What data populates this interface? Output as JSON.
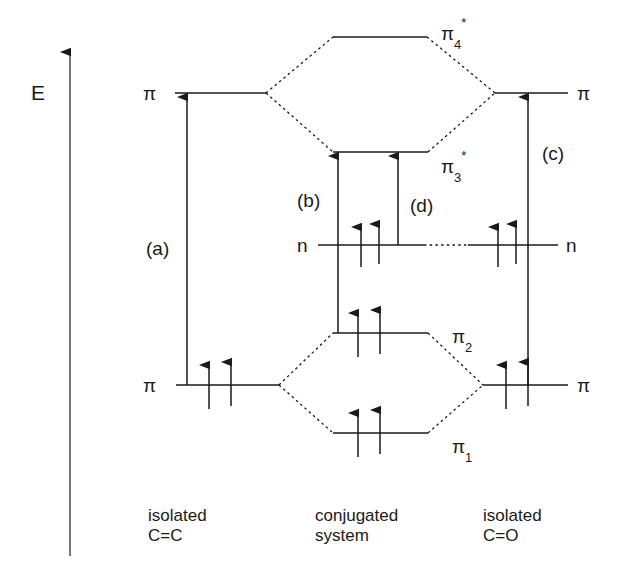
{
  "figure": {
    "kind": "molecular-orbital-energy-level-diagram",
    "energy_axis_label": "E"
  },
  "levels": {
    "left_pi_star": {
      "label": "π",
      "electrons": 0
    },
    "left_pi": {
      "label": "π",
      "electrons": 2
    },
    "center_pi4": {
      "label_base": "π",
      "label_sub": "4",
      "label_star": "*",
      "electrons": 0
    },
    "center_pi3": {
      "label_base": "π",
      "label_sub": "3",
      "label_star": "*",
      "electrons": 0
    },
    "center_pi2": {
      "label_base": "π",
      "label_sub": "2",
      "label_star": "",
      "electrons": 2
    },
    "center_pi1": {
      "label_base": "π",
      "label_sub": "1",
      "label_star": "",
      "electrons": 2
    },
    "left_n": {
      "label": "n",
      "electrons": 2
    },
    "right_n": {
      "label": "n",
      "electrons": 2
    },
    "right_pi_star": {
      "label": "π",
      "electrons": 0
    },
    "right_pi": {
      "label": "π",
      "electrons": 2
    }
  },
  "transitions": {
    "a": {
      "label": "(a)",
      "from": "left_pi",
      "to": "left_pi_star"
    },
    "b": {
      "label": "(b)",
      "from": "center_pi2",
      "to": "center_pi3"
    },
    "c": {
      "label": "(c)",
      "from": "right_pi",
      "to": "right_pi_star"
    },
    "d": {
      "label": "(d)",
      "from": "left_n",
      "to": "center_pi3"
    }
  },
  "columns": {
    "left": {
      "line1": "isolated",
      "line2": "C=C"
    },
    "center": {
      "line1": "conjugated",
      "line2": "system"
    },
    "right": {
      "line1": "isolated",
      "line2": "C=O"
    }
  },
  "style": {
    "stroke": "#1a1a1a",
    "background": "#ffffff"
  }
}
